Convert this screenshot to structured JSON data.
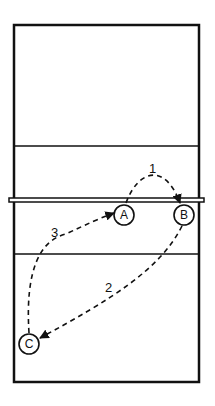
{
  "diagram": {
    "type": "volleyball-court-play",
    "court": {
      "stroke": "#111111",
      "background": "#ffffff"
    },
    "players": [
      {
        "id": "A",
        "label": "A",
        "x": 124,
        "y": 215
      },
      {
        "id": "B",
        "label": "B",
        "x": 184,
        "y": 215
      },
      {
        "id": "C",
        "label": "C",
        "x": 29,
        "y": 344
      }
    ],
    "paths": [
      {
        "id": "1",
        "label": "1",
        "from": "A",
        "to": "B"
      },
      {
        "id": "2",
        "label": "2",
        "from": "B",
        "to": "C"
      },
      {
        "id": "3",
        "label": "3",
        "from": "C",
        "to": "A"
      }
    ]
  }
}
